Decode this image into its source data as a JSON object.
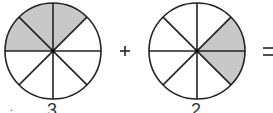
{
  "diagram": {
    "type": "fraction-addition",
    "colors": {
      "shade": "#c8c8c8",
      "stroke": "#222222",
      "background": "#ffffff"
    },
    "circles": [
      {
        "id": "circle-1",
        "sectors": 8,
        "shaded_sectors": 3,
        "numerator_label": "3",
        "shaded_positions": [
          "upper-left",
          "top-left",
          "top-right"
        ]
      },
      {
        "id": "circle-2",
        "sectors": 8,
        "shaded_sectors": 2,
        "numerator_label": "2",
        "shaded_positions": [
          "right-upper",
          "right-lower"
        ]
      }
    ],
    "operators": {
      "plus": "+",
      "equals": "="
    },
    "labels": {
      "left_dot": ".",
      "label1": "3",
      "label2": "2"
    }
  }
}
